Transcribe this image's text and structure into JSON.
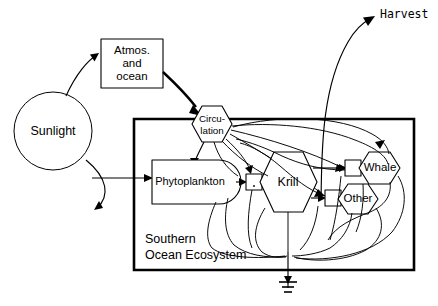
{
  "diagram": {
    "background_color": "#ffffff",
    "ink_color": "#000000",
    "system_box": {
      "caption_line1": "Southern",
      "caption_line2": "Ocean Ecosystem"
    },
    "nodes": {
      "sunlight": {
        "label": "Sunlight",
        "symbol": "circle-energy-source"
      },
      "atmos_ocean": {
        "label_line1": "Atmos.",
        "label_line2": "and",
        "label_line3": "ocean",
        "symbol": "rectangle-storage"
      },
      "circulation": {
        "label_line1": "Circu-",
        "label_line2": "lation",
        "symbol": "hexagon-consumer"
      },
      "phytoplankton": {
        "label": "Phytoplankton",
        "symbol": "bullet-producer"
      },
      "krill": {
        "label": "Krill",
        "symbol": "hexagon-consumer"
      },
      "whale": {
        "label": "Whale",
        "symbol": "hexagon-consumer"
      },
      "other": {
        "label": "Other",
        "symbol": "hexagon-consumer"
      }
    },
    "outputs": {
      "harvest": {
        "label": "Harvest",
        "symbol": "outflow-arrow"
      },
      "heat_sink": {
        "label": "",
        "symbol": "ground-heat-sink"
      }
    },
    "interaction_gates": [
      {
        "name": "phytoplankton-krill-gate",
        "symbol": "work-gate-square"
      },
      {
        "name": "krill-whale-gate",
        "symbol": "work-gate-square"
      },
      {
        "name": "krill-other-gate",
        "symbol": "work-gate-square"
      }
    ]
  }
}
